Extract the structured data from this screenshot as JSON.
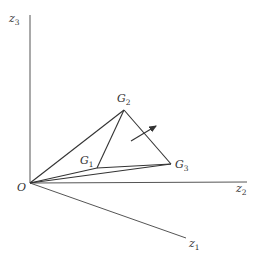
{
  "diagram": {
    "type": "3d-coordinate-diagram",
    "origin": {
      "label": "O",
      "x": 30,
      "y": 183
    },
    "axes": [
      {
        "id": "z3",
        "label": "z",
        "sub": "3",
        "end": {
          "x": 30,
          "y": 15
        }
      },
      {
        "id": "z2",
        "label": "z",
        "sub": "2",
        "end": {
          "x": 247,
          "y": 182
        }
      },
      {
        "id": "z1",
        "label": "z",
        "sub": "1",
        "end": {
          "x": 186,
          "y": 238
        }
      }
    ],
    "points": [
      {
        "id": "G1",
        "label": "G",
        "sub": "1",
        "x": 97,
        "y": 168
      },
      {
        "id": "G2",
        "label": "G",
        "sub": "2",
        "x": 124,
        "y": 110
      },
      {
        "id": "G3",
        "label": "G",
        "sub": "3",
        "x": 171,
        "y": 164
      }
    ],
    "arrow": {
      "from": {
        "x": 131,
        "y": 141
      },
      "to": {
        "x": 158,
        "y": 125
      },
      "meaning": "normal-vector"
    },
    "colors": {
      "lines": "#333333",
      "axes": "#555555",
      "background": "#ffffff"
    }
  }
}
